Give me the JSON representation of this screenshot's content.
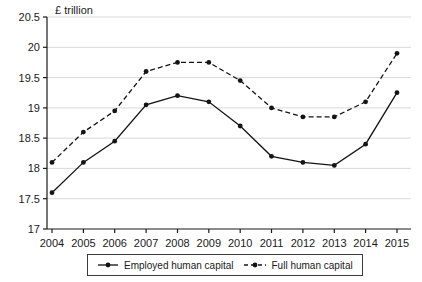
{
  "figure": {
    "background": "#ffffff",
    "axis_color": "#1a1a1a",
    "grid_color": "#d9d9d9",
    "series_color": "#141414"
  },
  "chart_data": {
    "type": "line",
    "title": "",
    "xlabel": "",
    "ylabel": "£ trillion",
    "x": [
      2004,
      2005,
      2006,
      2007,
      2008,
      2009,
      2010,
      2011,
      2012,
      2013,
      2014,
      2015
    ],
    "series": [
      {
        "name": "Employed human capital",
        "style": "solid",
        "marker": "circle",
        "values": [
          17.6,
          18.1,
          18.45,
          19.05,
          19.2,
          19.1,
          18.7,
          18.2,
          18.1,
          18.05,
          18.4,
          19.25
        ]
      },
      {
        "name": "Full human capital",
        "style": "dashed",
        "marker": "circle",
        "values": [
          18.1,
          18.6,
          18.95,
          19.6,
          19.75,
          19.75,
          19.45,
          19.0,
          18.85,
          18.85,
          19.1,
          19.9
        ]
      }
    ],
    "ylim": [
      17,
      20.5
    ],
    "ytick_step": 0.5,
    "grid": "horizontal",
    "legend_position": "bottom"
  }
}
